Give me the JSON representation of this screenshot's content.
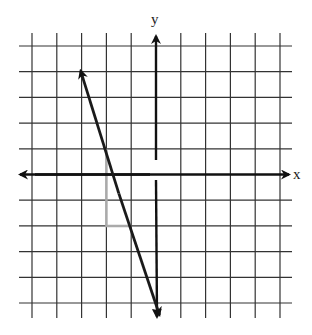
{
  "chart_data": {
    "type": "line",
    "title": "",
    "xlabel": "x",
    "ylabel": "y",
    "xlim": [
      -5,
      5
    ],
    "ylim": [
      -5,
      5
    ],
    "grid": true,
    "grid_step": 1,
    "tick_labels_shown": false,
    "series": [
      {
        "name": "line",
        "equation": "y = -3x - 5",
        "slope": -3,
        "y_intercept": -5,
        "points": [
          [
            -3,
            4
          ],
          [
            0,
            -5
          ]
        ],
        "arrows_both_ends": true,
        "color": "#1a1a1a"
      }
    ],
    "annotations": [
      {
        "type": "slope-triangle",
        "color": "#aaaaaa",
        "vertices": [
          [
            -2,
            1
          ],
          [
            -2,
            -2
          ],
          [
            -1,
            -2
          ]
        ],
        "rise": -3,
        "run": 1
      }
    ]
  },
  "labels": {
    "x_axis": "x",
    "y_axis": "y"
  },
  "colors": {
    "grid": "#333333",
    "axis": "#111111",
    "line": "#1a1a1a",
    "triangle": "#aaaaaa"
  }
}
